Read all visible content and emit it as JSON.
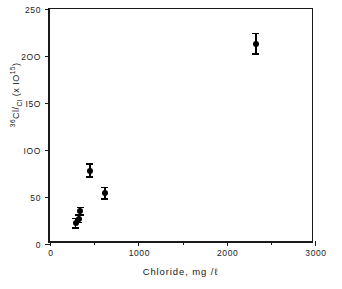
{
  "chart_data": {
    "type": "scatter",
    "title": "",
    "xlabel": "Chloride, mg /ℓ",
    "ylabel_prefix": "36",
    "ylabel_main": "Cl/",
    "ylabel_sub": "Cl",
    "ylabel_suffix": "(x IO",
    "ylabel_exp": "15",
    "ylabel_close": ")",
    "ylabel_full": "36Cl/Cl (x IO-15)",
    "xlim": [
      0,
      3000
    ],
    "ylim": [
      0,
      250
    ],
    "grid": false,
    "legend": null,
    "x_ticks": [
      0,
      1000,
      2000,
      3000
    ],
    "x_tick_labels": [
      "0",
      "1000",
      "2000",
      "3000"
    ],
    "x_minor_ticks": [
      500,
      1500,
      2500
    ],
    "y_ticks": [
      0,
      50,
      100,
      150,
      200,
      250
    ],
    "y_tick_labels": [
      "0",
      "50",
      "IOO",
      "I5O",
      "2OO",
      "250"
    ],
    "marker_color": "#000000",
    "axis_color": "#1a1a1a",
    "points": [
      {
        "x": 290,
        "y": 22,
        "yerr_low": 5,
        "yerr_high": 5
      },
      {
        "x": 325,
        "y": 27,
        "yerr_low": 4,
        "yerr_high": 4
      },
      {
        "x": 340,
        "y": 35,
        "yerr_low": 4,
        "yerr_high": 4
      },
      {
        "x": 450,
        "y": 78,
        "yerr_low": 7,
        "yerr_high": 7
      },
      {
        "x": 620,
        "y": 54,
        "yerr_low": 6,
        "yerr_high": 6
      },
      {
        "x": 2330,
        "y": 213,
        "yerr_low": 11,
        "yerr_high": 11
      }
    ]
  }
}
